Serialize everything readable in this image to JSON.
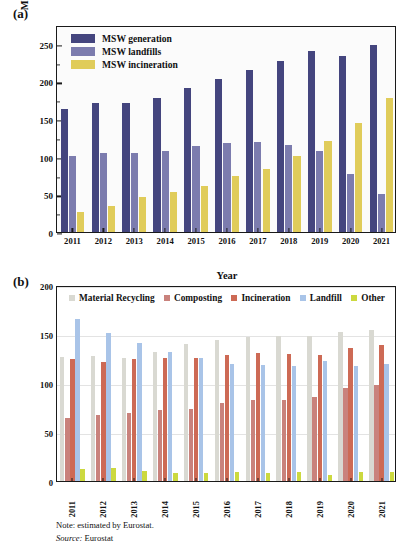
{
  "figure": {
    "panel_a_label": "(a)",
    "panel_b_label": "(b)",
    "note": "Note: estimated by Eurostat.",
    "source_keyword": "Source:",
    "source_value": "Eurostat"
  },
  "colors": {
    "msw_generation": "#44457e",
    "msw_landfills": "#7c7cae",
    "msw_incineration": "#e0cc5a",
    "material_recycling": "#d9d9d2",
    "composting": "#c9827c",
    "incineration": "#cd6a55",
    "landfill": "#a9c4e8",
    "other": "#ccd93f",
    "axis": "#1a1a1a",
    "grid": "#e3e3e3",
    "plot_a_bg": "#fbfbfb"
  },
  "chart_data": [
    {
      "type": "bar",
      "panel": "(a)",
      "title": "",
      "xlabel": "Year",
      "ylabel": "MSW generation (Million tonnes)",
      "categories": [
        "2011",
        "2012",
        "2013",
        "2014",
        "2015",
        "2016",
        "2017",
        "2018",
        "2019",
        "2020",
        "2021"
      ],
      "ylim": [
        0,
        275
      ],
      "yticks": [
        0,
        50,
        100,
        150,
        200,
        250
      ],
      "grid": false,
      "legend_position": "top-left",
      "series": [
        {
          "name": "MSW generation",
          "values": [
            163,
            171,
            172,
            178,
            191,
            203,
            215,
            227,
            241,
            234,
            248
          ]
        },
        {
          "name": "MSW landfills",
          "values": [
            101,
            105,
            105,
            107,
            114,
            118,
            119,
            116,
            108,
            77,
            51
          ]
        },
        {
          "name": "MSW incineration",
          "values": [
            26,
            35,
            46,
            53,
            61,
            74,
            84,
            101,
            121,
            145,
            178
          ]
        }
      ]
    },
    {
      "type": "bar",
      "panel": "(b)",
      "title": "",
      "xlabel": "",
      "ylabel": "",
      "categories": [
        "2011",
        "2012",
        "2013",
        "2014",
        "2015",
        "2016",
        "2017",
        "2018",
        "2019",
        "2020",
        "2021"
      ],
      "ylim": [
        0,
        200
      ],
      "yticks": [
        0,
        50,
        100,
        150,
        200
      ],
      "grid": true,
      "legend_position": "top",
      "series": [
        {
          "name": "Material Recycling",
          "values": [
            127,
            128,
            126,
            132,
            140,
            144,
            147,
            148,
            148,
            152,
            154
          ]
        },
        {
          "name": "Composting",
          "values": [
            64,
            67,
            69,
            72,
            73,
            80,
            83,
            83,
            86,
            95,
            98
          ]
        },
        {
          "name": "Incineration",
          "values": [
            124,
            121,
            125,
            126,
            126,
            129,
            131,
            130,
            129,
            136,
            139
          ]
        },
        {
          "name": "Landfill",
          "values": [
            165,
            151,
            141,
            132,
            126,
            119,
            118,
            117,
            122,
            117,
            119
          ]
        },
        {
          "name": "Other",
          "values": [
            12,
            13,
            10,
            8,
            8,
            9,
            8,
            9,
            6,
            9,
            9
          ]
        }
      ]
    }
  ]
}
